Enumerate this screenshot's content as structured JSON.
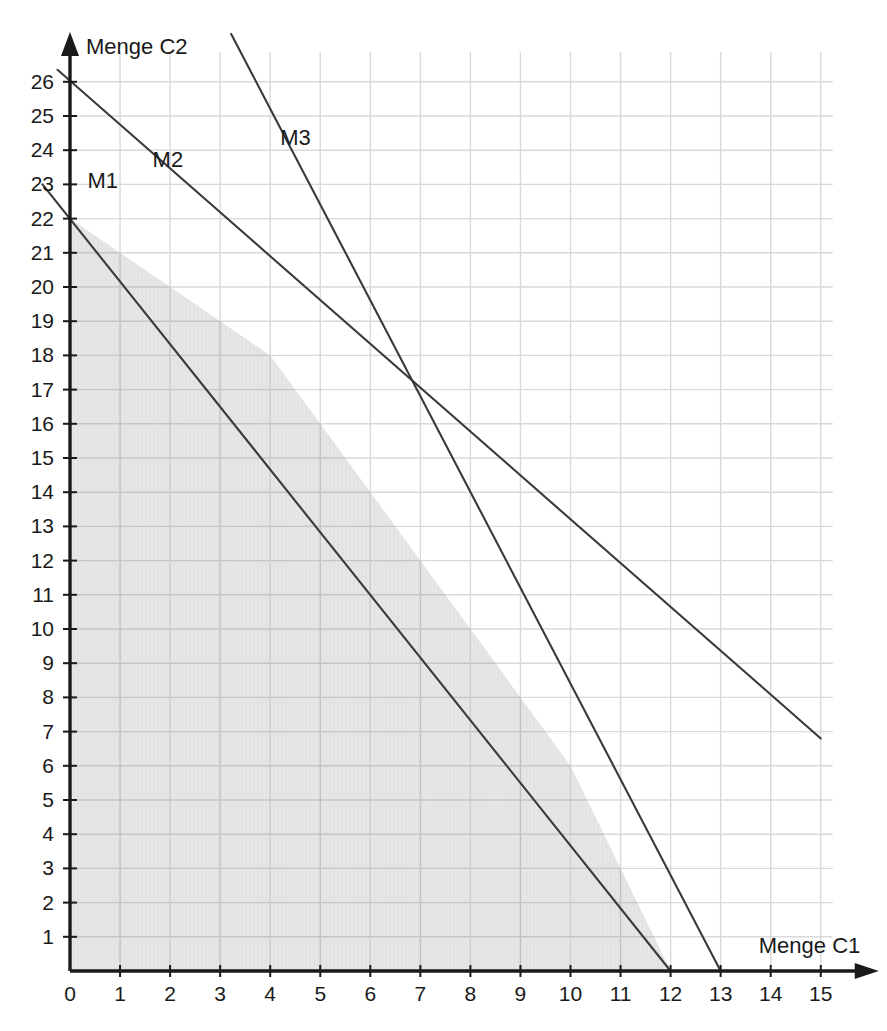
{
  "chart_data": {
    "type": "line",
    "title": "",
    "xlabel": "Menge C1",
    "ylabel": "Menge C2",
    "xlim": [
      0,
      15
    ],
    "ylim": [
      0,
      26
    ],
    "grid": true,
    "legend_position": "inline-labels",
    "x_ticks": [
      0,
      1,
      2,
      3,
      4,
      5,
      6,
      7,
      8,
      9,
      10,
      11,
      12,
      13,
      14,
      15
    ],
    "y_ticks": [
      0,
      1,
      2,
      3,
      4,
      5,
      6,
      7,
      8,
      9,
      10,
      11,
      12,
      13,
      14,
      15,
      16,
      17,
      18,
      19,
      20,
      21,
      22,
      23,
      24,
      25,
      26
    ],
    "x_tick_labels": [
      "0",
      "1",
      "2",
      "3",
      "4",
      "5",
      "6",
      "7",
      "8",
      "9",
      "10",
      "11",
      "12",
      "13",
      "14",
      "15"
    ],
    "y_tick_labels": [
      "0",
      "1",
      "2",
      "3",
      "4",
      "5",
      "6",
      "7",
      "8",
      "9",
      "10",
      "11",
      "12",
      "13",
      "14",
      "15",
      "16",
      "17",
      "18",
      "19",
      "20",
      "21",
      "22",
      "23",
      "24",
      "25",
      "26"
    ],
    "series": [
      {
        "name": "M1",
        "label": "M1",
        "label_x": 0.35,
        "label_y": 22.9,
        "x_intercept": 12,
        "y_intercept": 22,
        "slope": -1.8333,
        "draw_from": [
          -0.55,
          23.0
        ],
        "draw_to": [
          12.0,
          0.0
        ],
        "color": "#3a3a3a"
      },
      {
        "name": "M2",
        "label": "M2",
        "label_x": 1.65,
        "label_y": 23.5,
        "x_intercept": 20.3,
        "y_intercept": 26,
        "slope": -1.28,
        "draw_from": [
          -0.25,
          26.35
        ],
        "draw_to": [
          15.0,
          6.8
        ],
        "color": "#3a3a3a"
      },
      {
        "name": "M3",
        "label": "M3",
        "label_x": 4.2,
        "label_y": 24.15,
        "x_intercept": 13,
        "y_intercept": 32.5,
        "slope": -2.5,
        "draw_from": [
          3.22,
          27.4
        ],
        "draw_to": [
          13.0,
          0.0
        ],
        "color": "#3a3a3a"
      }
    ],
    "feasible_region": {
      "name": "feasible-region",
      "fill": "#e6e6e6",
      "vertices": [
        [
          0,
          0
        ],
        [
          0,
          22
        ],
        [
          4,
          18
        ],
        [
          10,
          6
        ],
        [
          12,
          0
        ]
      ]
    },
    "intersections": [
      {
        "label": "M1 x M2",
        "x": 4,
        "y": 18
      },
      {
        "label": "M2 x M3",
        "x": 7,
        "y": 15
      },
      {
        "label": "M1 x M3",
        "x": 10,
        "y": 6
      }
    ],
    "colors": {
      "grid": "#d9d9d9",
      "axis": "#1a1a1a",
      "line": "#3a3a3a",
      "shade": "#e6e6e6",
      "background": "#ffffff"
    }
  }
}
